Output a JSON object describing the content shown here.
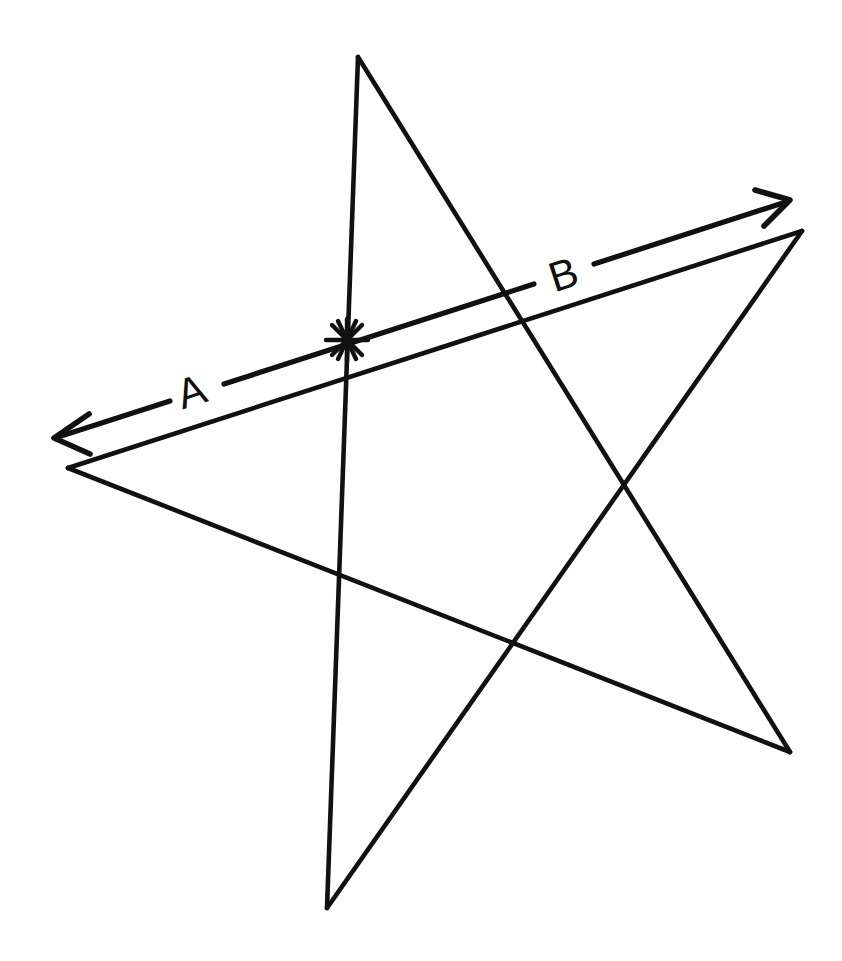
{
  "figure": {
    "kind": "hand-drawn-geometry-diagram",
    "background_color": "#ffffff",
    "ink_color": "#111111",
    "canvas": {
      "width": 842,
      "height": 961
    }
  },
  "labels": {
    "left_segment": "A",
    "right_segment": "B"
  },
  "label_positions": {
    "left_segment": {
      "x": 196,
      "y": 405
    },
    "right_segment": {
      "x": 568,
      "y": 288
    }
  },
  "pentagram": {
    "points": [
      {
        "name": "top",
        "x": 358,
        "y": 57
      },
      {
        "name": "right",
        "x": 802,
        "y": 231
      },
      {
        "name": "bottom-left",
        "x": 327,
        "y": 908
      },
      {
        "name": "left",
        "x": 68,
        "y": 468
      },
      {
        "name": "bottom-right",
        "x": 790,
        "y": 752
      }
    ],
    "path_order": [
      "top",
      "bottom-right",
      "left",
      "right",
      "bottom-left",
      "top"
    ],
    "interior_intersections": [
      {
        "x": 347,
        "y": 340
      },
      {
        "x": 627,
        "y": 482
      },
      {
        "x": 515,
        "y": 640
      },
      {
        "x": 344,
        "y": 392
      },
      {
        "x": 553,
        "y": 283
      }
    ]
  },
  "arrow_line": {
    "start": {
      "x": 54,
      "y": 438
    },
    "end": {
      "x": 790,
      "y": 200
    },
    "double_headed": true,
    "head_length": 34,
    "marked_point": {
      "x": 347,
      "y": 340,
      "glyph": "asterisk"
    }
  },
  "asterisk_mark": {
    "center": {
      "x": 347,
      "y": 340
    },
    "ray_count": 8,
    "radius": 22
  }
}
